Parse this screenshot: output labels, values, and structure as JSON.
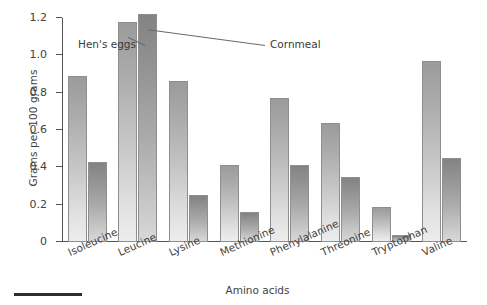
{
  "chart_data": {
    "type": "bar",
    "title": "",
    "subtitle": "",
    "xlabel": "Amino acids",
    "ylabel": "Grams per 100 grams",
    "categories": [
      "Isoleucine",
      "Leucine",
      "Lysine",
      "Methionine",
      "Phenylalanine",
      "Threonine",
      "Tryptophan",
      "Valine"
    ],
    "series": [
      {
        "name": "Hen's eggs",
        "values": [
          0.89,
          1.18,
          0.86,
          0.41,
          0.77,
          0.64,
          0.19,
          0.97
        ],
        "color": "#c0c0c0"
      },
      {
        "name": "Cornmeal",
        "values": [
          0.43,
          1.22,
          0.25,
          0.16,
          0.41,
          0.35,
          0.04,
          0.45
        ],
        "color": "#a3a3a3"
      }
    ],
    "ylim": [
      0,
      1.2
    ],
    "ytick_labels": [
      "0",
      "0.2",
      "0.4",
      "0.6",
      "0.8",
      "1.0",
      "1.2"
    ],
    "ytick_values": [
      0,
      0.2,
      0.4,
      0.6,
      0.8,
      1.0,
      1.2
    ],
    "grid": false,
    "legend_position": "annotations-on-bars",
    "annotations": [
      {
        "text": "Hen's eggs",
        "points_to_category": "Leucine",
        "points_to_series": "Hen's eggs"
      },
      {
        "text": "Cornmeal",
        "points_to_category": "Leucine",
        "points_to_series": "Cornmeal"
      }
    ]
  },
  "figure": {
    "background_color": "#ffffff",
    "axis_color": "#545454",
    "text_color": "#3b3b3b"
  }
}
